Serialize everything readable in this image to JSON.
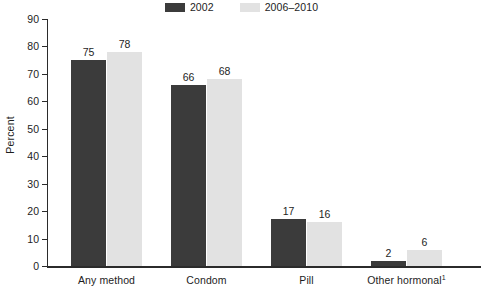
{
  "chart_data": {
    "type": "bar",
    "title": "",
    "subtitle": "",
    "xlabel": "",
    "ylabel": "Percent",
    "ylim": [
      0,
      90
    ],
    "ytick_step": 10,
    "yticks": [
      90,
      80,
      70,
      60,
      50,
      40,
      30,
      20,
      10,
      0
    ],
    "grid": false,
    "legend_position": "top-center",
    "categories": [
      "Any method",
      "Condom",
      "Pill",
      "Other hormonal"
    ],
    "category_footnotes": [
      "",
      "",
      "",
      "1"
    ],
    "series": [
      {
        "name": "2002",
        "color": "#3b3b3b",
        "values": [
          75,
          66,
          17,
          2
        ]
      },
      {
        "name": "2006–2010",
        "color": "#e2e2e2",
        "values": [
          78,
          68,
          16,
          6
        ]
      }
    ],
    "value_labels": {
      "any_method": [
        "75",
        "78"
      ],
      "condom": [
        "66",
        "68"
      ],
      "pill": [
        "17",
        "16"
      ],
      "other_hormonal": [
        "2",
        "6"
      ]
    }
  },
  "legend": {
    "entries": [
      {
        "label": "2002",
        "swatch_color": "#3b3b3b"
      },
      {
        "label": "2006–2010",
        "swatch_color": "#e2e2e2"
      }
    ]
  },
  "axis": {
    "y_title": "Percent",
    "y_tick_labels": [
      "90",
      "80",
      "70",
      "60",
      "50",
      "40",
      "30",
      "20",
      "10",
      "0"
    ]
  },
  "categories": [
    {
      "label": "Any method",
      "footnote": ""
    },
    {
      "label": "Condom",
      "footnote": ""
    },
    {
      "label": "Pill",
      "footnote": ""
    },
    {
      "label": "Other hormonal",
      "footnote": "1"
    }
  ],
  "colors": {
    "series_2002": "#3b3b3b",
    "series_2006_2010": "#e2e2e2",
    "axis": "#2b2b2b",
    "text": "#1d1d1d",
    "background": "#ffffff"
  }
}
